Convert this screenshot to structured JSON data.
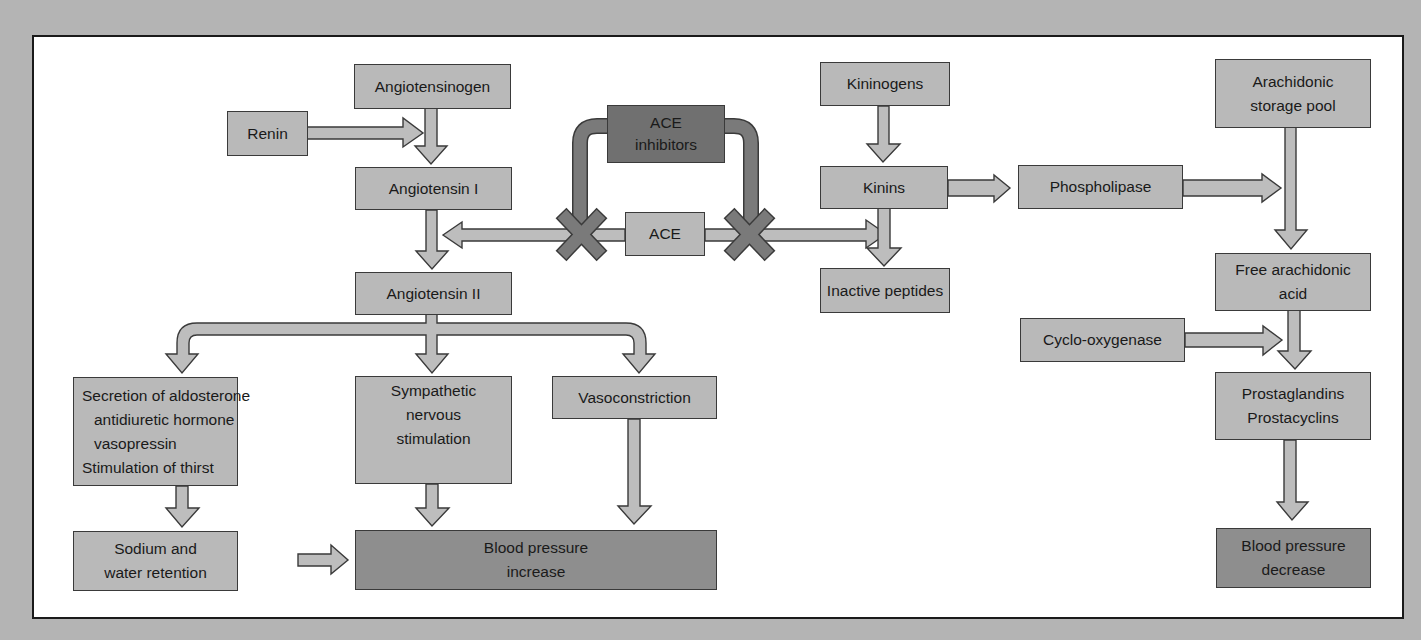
{
  "diagram": {
    "title": "",
    "colors": {
      "background": "#b4b4b4",
      "panel": "#ffffff",
      "box_fill": "#b9b9b9",
      "result_fill": "#8e8e8e",
      "inhibitor_fill": "#707070",
      "arrow_fill": "#bdbdbd",
      "block_arrow_fill": "#7a7a7a"
    },
    "nodes": {
      "angiotensinogen": {
        "lines": [
          "Angiotensinogen"
        ]
      },
      "renin": {
        "lines": [
          "Renin"
        ]
      },
      "angiotensin_1": {
        "lines": [
          "Angiotensin I"
        ]
      },
      "angiotensin_2": {
        "lines": [
          "Angiotensin II"
        ]
      },
      "ace_inhibitors": {
        "lines": [
          "ACE",
          "inhibitors"
        ]
      },
      "ace": {
        "lines": [
          "ACE"
        ]
      },
      "kininogens": {
        "lines": [
          "Kininogens"
        ]
      },
      "kinins": {
        "lines": [
          "Kinins"
        ]
      },
      "inactive_peptides": {
        "lines": [
          "Inactive peptides"
        ]
      },
      "phospholipase": {
        "lines": [
          "Phospholipase"
        ]
      },
      "arachidonic_pool": {
        "lines": [
          "Arachidonic",
          "storage pool"
        ]
      },
      "free_arachidonic": {
        "lines": [
          "Free arachidonic",
          "acid"
        ]
      },
      "cyclooxygenase": {
        "lines": [
          "Cyclo-oxygenase"
        ]
      },
      "prostaglandins": {
        "lines": [
          "Prostaglandins",
          "Prostacyclins"
        ]
      },
      "bp_decrease": {
        "lines": [
          "Blood pressure",
          "decrease"
        ]
      },
      "secretion": {
        "lines": [
          "Secretion of aldosterone",
          "antidiuretic hormone",
          "vasopressin",
          "Stimulation of thirst"
        ]
      },
      "sympathetic": {
        "lines": [
          "Sympathetic",
          "nervous",
          "stimulation"
        ]
      },
      "vasoconstriction": {
        "lines": [
          "Vasoconstriction"
        ]
      },
      "sodium": {
        "lines": [
          "Sodium and",
          "water retention"
        ]
      },
      "bp_increase": {
        "lines": [
          "Blood pressure",
          "increase"
        ]
      }
    },
    "edges": [
      {
        "from": "angiotensinogen",
        "to": "angiotensin_1"
      },
      {
        "from": "renin",
        "to": "angiotensin_1",
        "label": "acts on"
      },
      {
        "from": "angiotensin_1",
        "to": "angiotensin_2"
      },
      {
        "from": "ace",
        "to": "angiotensin_1_to_2",
        "blocked_by": "ace_inhibitors"
      },
      {
        "from": "ace",
        "to": "kinins_to_inactive",
        "blocked_by": "ace_inhibitors"
      },
      {
        "from": "kininogens",
        "to": "kinins"
      },
      {
        "from": "kinins",
        "to": "inactive_peptides"
      },
      {
        "from": "kinins",
        "to": "phospholipase"
      },
      {
        "from": "phospholipase",
        "to": "arachidonic_to_free"
      },
      {
        "from": "arachidonic_pool",
        "to": "free_arachidonic"
      },
      {
        "from": "cyclooxygenase",
        "to": "free_to_prostaglandins"
      },
      {
        "from": "free_arachidonic",
        "to": "prostaglandins"
      },
      {
        "from": "prostaglandins",
        "to": "bp_decrease"
      },
      {
        "from": "angiotensin_2",
        "to": "secretion"
      },
      {
        "from": "angiotensin_2",
        "to": "sympathetic"
      },
      {
        "from": "angiotensin_2",
        "to": "vasoconstriction"
      },
      {
        "from": "secretion",
        "to": "sodium"
      },
      {
        "from": "sodium",
        "to": "bp_increase"
      },
      {
        "from": "sympathetic",
        "to": "bp_increase"
      },
      {
        "from": "vasoconstriction",
        "to": "bp_increase"
      }
    ]
  }
}
